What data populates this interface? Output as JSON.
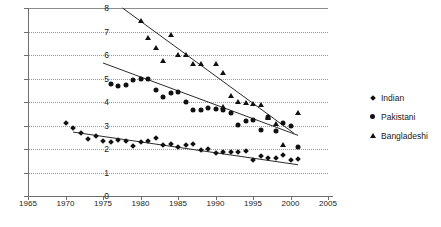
{
  "chart_data": {
    "type": "scatter",
    "title": "",
    "xlabel": "",
    "ylabel": "",
    "xlim": [
      1965,
      2005
    ],
    "ylim": [
      0,
      8
    ],
    "xticks": [
      1965,
      1970,
      1975,
      1980,
      1985,
      1990,
      1995,
      2000,
      2005
    ],
    "yticks": [
      0,
      1,
      2,
      3,
      4,
      5,
      6,
      7,
      8
    ],
    "grid": true,
    "legend_position": "right",
    "series": [
      {
        "name": "Indian",
        "marker": "diamond",
        "x": [
          1970,
          1971,
          1972,
          1973,
          1974,
          1975,
          1976,
          1977,
          1978,
          1979,
          1980,
          1981,
          1982,
          1983,
          1984,
          1985,
          1986,
          1987,
          1988,
          1989,
          1990,
          1991,
          1992,
          1993,
          1994,
          1995,
          1996,
          1997,
          1998,
          1999,
          2000,
          2001
        ],
        "y": [
          3.12,
          2.9,
          2.68,
          2.41,
          2.55,
          2.34,
          2.31,
          2.4,
          2.36,
          2.14,
          2.29,
          2.35,
          2.48,
          2.18,
          2.22,
          2.1,
          2.15,
          2.21,
          1.95,
          2.0,
          1.83,
          1.88,
          1.87,
          1.88,
          1.9,
          1.54,
          1.72,
          1.62,
          1.63,
          1.75,
          1.52,
          1.58
        ],
        "trend": {
          "x0": 1971,
          "y0": 2.72,
          "x1": 2001,
          "y1": 1.33
        }
      },
      {
        "name": "Pakistani",
        "marker": "circle",
        "x": [
          1976,
          1977,
          1978,
          1979,
          1980,
          1981,
          1982,
          1983,
          1984,
          1985,
          1986,
          1987,
          1988,
          1989,
          1990,
          1991,
          1992,
          1993,
          1994,
          1995,
          1996,
          1997,
          1998,
          1999,
          2000,
          2001
        ],
        "y": [
          4.76,
          4.68,
          4.73,
          4.92,
          4.98,
          4.97,
          4.5,
          4.22,
          4.38,
          4.44,
          4.0,
          3.67,
          3.66,
          3.76,
          3.72,
          3.65,
          3.52,
          3.02,
          3.2,
          3.22,
          2.82,
          3.36,
          2.78,
          3.1,
          2.96,
          2.07
        ],
        "trend": {
          "x0": 1975,
          "y0": 5.66,
          "x1": 2001,
          "y1": 2.58
        }
      },
      {
        "name": "Bangladeshi",
        "marker": "triangle",
        "x": [
          1980,
          1981,
          1982,
          1983,
          1984,
          1985,
          1986,
          1987,
          1988,
          1990,
          1991,
          1991,
          1992,
          1993,
          1994,
          1995,
          1996,
          1997,
          1997,
          1998,
          1999,
          2001
        ],
        "y": [
          7.43,
          6.72,
          6.3,
          5.74,
          6.85,
          6.02,
          6.0,
          5.62,
          5.63,
          5.61,
          5.25,
          3.78,
          4.24,
          4.0,
          3.95,
          3.9,
          3.88,
          3.38,
          3.3,
          3.08,
          2.15,
          3.52
        ],
        "trend": {
          "x0": 1977.6,
          "y0": 8.0,
          "x1": 2000.5,
          "y1": 2.66
        }
      }
    ]
  },
  "legend": {
    "items": [
      {
        "label": "Indian",
        "marker": "diamond"
      },
      {
        "label": "Pakistani",
        "marker": "circle"
      },
      {
        "label": "Bangladeshi",
        "marker": "triangle"
      }
    ]
  }
}
